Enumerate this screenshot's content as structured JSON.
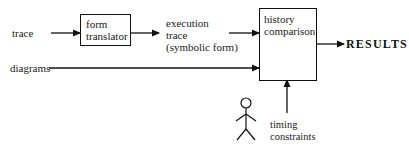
{
  "diagram": {
    "inputs": {
      "trace": "trace",
      "diagrams": "diagrams"
    },
    "nodes": {
      "form_translator": {
        "line1": "form",
        "line2": "translator"
      },
      "history_comparison": {
        "line1": "history",
        "line2": "comparison"
      }
    },
    "intermediate": {
      "line1": "execution",
      "line2": "trace",
      "line3": "(symbolic form)"
    },
    "output": "RESULTS",
    "actor": {
      "icon": "stick-figure-icon",
      "label_line1": "timing",
      "label_line2": "constraints"
    },
    "edges": [
      {
        "from": "trace",
        "to": "form translator"
      },
      {
        "from": "form translator",
        "to": "execution trace (symbolic form)"
      },
      {
        "from": "execution trace (symbolic form)",
        "to": "history comparison"
      },
      {
        "from": "diagrams",
        "to": "history comparison"
      },
      {
        "from": "history comparison",
        "to": "RESULTS"
      },
      {
        "from": "timing constraints",
        "to": "history comparison"
      }
    ]
  }
}
